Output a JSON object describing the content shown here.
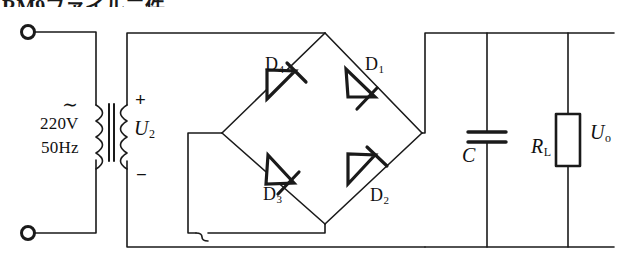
{
  "figure": {
    "title_fragment": "RM9ファイル二件",
    "type": "schematic-diagram",
    "width": 626,
    "height": 263,
    "line_color": "#1a1a1a",
    "background_color": "#ffffff"
  },
  "source": {
    "ac_symbol": "∼",
    "voltage": "220V",
    "frequency": "50Hz",
    "terminal_top_name": "input-terminal-top",
    "terminal_bottom_name": "input-terminal-bottom"
  },
  "transformer": {
    "name": "step-down-transformer",
    "secondary_plus": "+",
    "secondary_minus": "−",
    "secondary_voltage_symbol": "U",
    "secondary_voltage_subscript": "2"
  },
  "bridge": {
    "name": "diode-bridge-rectifier",
    "diodes": [
      {
        "id": "D1",
        "label": "D",
        "subscript": "1",
        "position": "top-right",
        "direction": "top-node-to-right-node"
      },
      {
        "id": "D2",
        "label": "D",
        "subscript": "2",
        "position": "bottom-right",
        "direction": "bottom-node-to-right-node"
      },
      {
        "id": "D3",
        "label": "D",
        "subscript": "3",
        "position": "bottom-left",
        "direction": "left-node-to-bottom-node"
      },
      {
        "id": "D4",
        "label": "D",
        "subscript": "4",
        "position": "top-left",
        "direction": "left-node-to-top-node"
      }
    ]
  },
  "filter": {
    "capacitor_label": "C",
    "capacitor_name": "filter-capacitor"
  },
  "load": {
    "resistor_symbol": "R",
    "resistor_subscript": "L",
    "resistor_name": "load-resistor",
    "output_voltage_symbol": "U",
    "output_voltage_subscript": "o"
  }
}
